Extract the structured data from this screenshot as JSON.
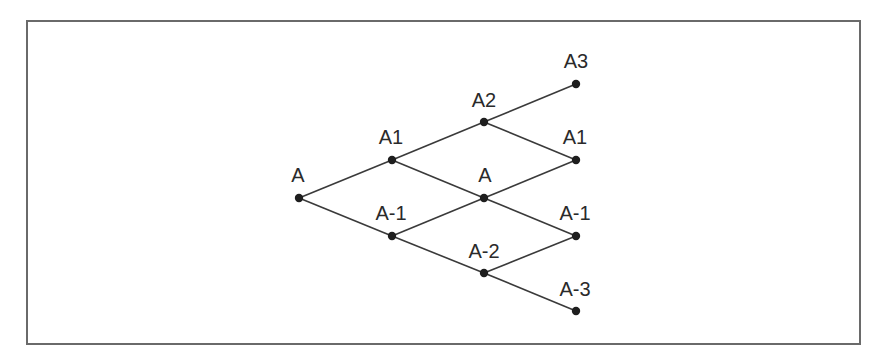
{
  "diagram": {
    "type": "binomial-tree",
    "colors": {
      "frame": "#6a6a6a",
      "edge": "#3a3a3a",
      "node": "#1e1e1e",
      "text": "#2a2a2a"
    },
    "nodes": [
      {
        "id": "n0",
        "label": "A",
        "x": 299,
        "y": 198,
        "label_x": 298,
        "label_y": 182
      },
      {
        "id": "n1u",
        "label": "A1",
        "x": 392,
        "y": 160,
        "label_x": 391,
        "label_y": 144
      },
      {
        "id": "n1d",
        "label": "A-1",
        "x": 392,
        "y": 236,
        "label_x": 391,
        "label_y": 220
      },
      {
        "id": "n2u",
        "label": "A2",
        "x": 484,
        "y": 122,
        "label_x": 484,
        "label_y": 107
      },
      {
        "id": "n2m",
        "label": "A",
        "x": 484,
        "y": 198,
        "label_x": 485,
        "label_y": 182
      },
      {
        "id": "n2d",
        "label": "A-2",
        "x": 484,
        "y": 273,
        "label_x": 484,
        "label_y": 258
      },
      {
        "id": "n3a",
        "label": "A3",
        "x": 576,
        "y": 84,
        "label_x": 576,
        "label_y": 68
      },
      {
        "id": "n3b",
        "label": "A1",
        "x": 576,
        "y": 160,
        "label_x": 575,
        "label_y": 144
      },
      {
        "id": "n3c",
        "label": "A-1",
        "x": 576,
        "y": 236,
        "label_x": 575,
        "label_y": 220
      },
      {
        "id": "n3d",
        "label": "A-3",
        "x": 576,
        "y": 311,
        "label_x": 575,
        "label_y": 296
      }
    ],
    "edges": [
      {
        "from": "n0",
        "to": "n1u"
      },
      {
        "from": "n0",
        "to": "n1d"
      },
      {
        "from": "n1u",
        "to": "n2u"
      },
      {
        "from": "n1u",
        "to": "n2m"
      },
      {
        "from": "n1d",
        "to": "n2m"
      },
      {
        "from": "n1d",
        "to": "n2d"
      },
      {
        "from": "n2u",
        "to": "n3a"
      },
      {
        "from": "n2u",
        "to": "n3b"
      },
      {
        "from": "n2m",
        "to": "n3b"
      },
      {
        "from": "n2m",
        "to": "n3c"
      },
      {
        "from": "n2d",
        "to": "n3c"
      },
      {
        "from": "n2d",
        "to": "n3d"
      }
    ]
  }
}
